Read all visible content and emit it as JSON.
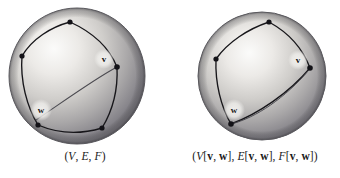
{
  "figure": {
    "background": "#ffffff",
    "ink": "#1a1a1a",
    "panels": [
      {
        "id": "left",
        "name": "sphere-graph-original",
        "caption": "(V, E, F)",
        "caption_parts": [
          {
            "text": "(",
            "style": "upright"
          },
          {
            "text": "V",
            "style": "italic"
          },
          {
            "text": ", ",
            "style": "upright"
          },
          {
            "text": "E",
            "style": "italic"
          },
          {
            "text": ", ",
            "style": "upright"
          },
          {
            "text": "F",
            "style": "italic"
          },
          {
            "text": ")",
            "style": "upright"
          }
        ],
        "sphere": {
          "cx": 77,
          "cy": 76,
          "r": 68,
          "highlight_x": 52,
          "highlight_y": 48,
          "light": "#f2f1ef",
          "mid": "#b9b7b4",
          "dark": "#78767a",
          "rim": "#5d5c60"
        },
        "vertices": [
          {
            "name": "vertex-top",
            "x": 70,
            "y": 22
          },
          {
            "name": "vertex-left",
            "x": 22,
            "y": 56
          },
          {
            "name": "vertex-right-v",
            "x": 117,
            "y": 67
          },
          {
            "name": "vertex-bottom-left-w",
            "x": 38,
            "y": 125
          },
          {
            "name": "vertex-bottom-right",
            "x": 102,
            "y": 128
          }
        ],
        "labels": [
          {
            "name": "vertex-label-v",
            "text": "v",
            "x": 104,
            "y": 59,
            "halo_r": 10
          },
          {
            "name": "vertex-label-w",
            "text": "w",
            "x": 41,
            "y": 110,
            "halo_r": 11
          }
        ],
        "edge_count": 6,
        "note": "five vertices; edge v-w drawn across the sphere face"
      },
      {
        "id": "right",
        "name": "sphere-graph-contracted",
        "caption": "(V[v, w], E[v, w], F[v, w])",
        "caption_parts": [
          {
            "text": "(",
            "style": "upright"
          },
          {
            "text": "V",
            "style": "italic"
          },
          {
            "text": "[",
            "style": "upright"
          },
          {
            "text": "v",
            "style": "bold"
          },
          {
            "text": ", ",
            "style": "upright"
          },
          {
            "text": "w",
            "style": "bold"
          },
          {
            "text": "], ",
            "style": "upright"
          },
          {
            "text": "E",
            "style": "italic"
          },
          {
            "text": "[",
            "style": "upright"
          },
          {
            "text": "v",
            "style": "bold"
          },
          {
            "text": ", ",
            "style": "upright"
          },
          {
            "text": "w",
            "style": "bold"
          },
          {
            "text": "], ",
            "style": "upright"
          },
          {
            "text": "F",
            "style": "italic"
          },
          {
            "text": "[",
            "style": "upright"
          },
          {
            "text": "v",
            "style": "bold"
          },
          {
            "text": ", ",
            "style": "upright"
          },
          {
            "text": "w",
            "style": "bold"
          },
          {
            "text": "])",
            "style": "upright"
          }
        ],
        "sphere": {
          "cx": 92,
          "cy": 76,
          "r": 64,
          "highlight_x": 70,
          "highlight_y": 50,
          "light": "#f2f1ef",
          "mid": "#b9b7b4",
          "dark": "#78767a",
          "rim": "#5d5c60"
        },
        "vertices": [
          {
            "name": "vertex-top",
            "x": 99,
            "y": 22
          },
          {
            "name": "vertex-left",
            "x": 46,
            "y": 59
          },
          {
            "name": "vertex-right-v",
            "x": 140,
            "y": 68
          },
          {
            "name": "vertex-bottom-left-w",
            "x": 61,
            "y": 124
          }
        ],
        "labels": [
          {
            "name": "vertex-label-v",
            "text": "v",
            "x": 128,
            "y": 60,
            "halo_r": 10
          },
          {
            "name": "vertex-label-w",
            "text": "w",
            "x": 64,
            "y": 110,
            "halo_r": 11
          }
        ],
        "edge_count": 5,
        "note": "four vertices; the v-w edge has been contracted away"
      }
    ]
  }
}
